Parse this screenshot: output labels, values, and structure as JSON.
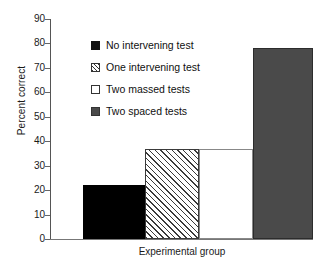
{
  "chart_data": {
    "type": "bar",
    "title": "",
    "xlabel": "Experimental group",
    "ylabel": "Percent correct",
    "categories": [
      "No intervening test",
      "One intervening test",
      "Two massed tests",
      "Two spaced tests"
    ],
    "values": [
      22,
      37,
      37,
      78
    ],
    "ylim": [
      0,
      90
    ],
    "yticks": [
      0,
      10,
      20,
      30,
      40,
      50,
      60,
      70,
      80,
      90
    ],
    "ytick_labels": [
      "0",
      "10",
      "20",
      "30",
      "40",
      "50",
      "60",
      "70",
      "80",
      "90"
    ],
    "xticks": [],
    "xtick_labels": [],
    "grid": false,
    "legend_position": "upper-left-inside",
    "series": [
      {
        "name": "No intervening test",
        "value": 22,
        "fill": "solid-black",
        "color": "#000000"
      },
      {
        "name": "One intervening test",
        "value": 37,
        "fill": "diagonal-hatch",
        "color": "#3a3a3a"
      },
      {
        "name": "Two massed tests",
        "value": 37,
        "fill": "white",
        "color": "#ffffff"
      },
      {
        "name": "Two spaced tests",
        "value": 78,
        "fill": "solid-gray",
        "color": "#4a4a4a"
      }
    ]
  },
  "legend": {
    "items": [
      {
        "label": "No intervening test",
        "swatch": "legend-swatch-black"
      },
      {
        "label": "One intervening test",
        "swatch": "legend-swatch-hatched"
      },
      {
        "label": "Two massed tests",
        "swatch": "legend-swatch-white"
      },
      {
        "label": "Two spaced tests",
        "swatch": "legend-swatch-gray"
      }
    ]
  },
  "axes": {
    "y_title": "Percent correct",
    "x_title": "Experimental group"
  }
}
